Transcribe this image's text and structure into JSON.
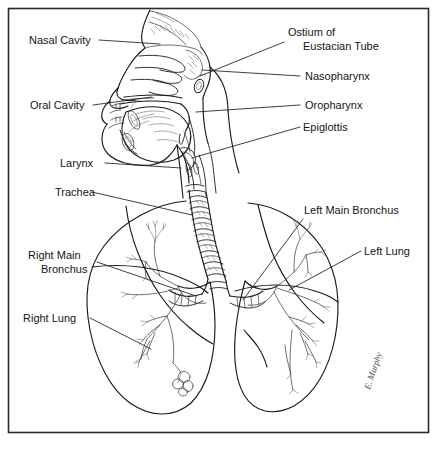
{
  "figure": {
    "background_color": "#ffffff",
    "line_color": "#1a1a1a",
    "frame_color": "#2b2b2b",
    "text_color": "#151515",
    "signature": "E. Murphy"
  },
  "labels": {
    "nasal_cavity": "Nasal Cavity",
    "oral_cavity": "Oral Cavity",
    "larynx": "Larynx",
    "trachea": "Trachea",
    "right_main_bronchus_line1": "Right Main",
    "right_main_bronchus_line2": "Bronchus",
    "right_lung": "Right Lung",
    "ostium_line1": "Ostium of",
    "ostium_line2": "Eustacian Tube",
    "nasopharynx": "Nasopharynx",
    "oropharynx": "Oropharynx",
    "epiglottis": "Epiglottis",
    "left_main_bronchus": "Left Main Bronchus",
    "left_lung": "Left Lung"
  },
  "structures": [
    "head-sagittal-outline",
    "nasal-turbinates",
    "frontal-sinus",
    "sphenoid-sinus",
    "hard-palate",
    "soft-palate",
    "tongue",
    "uvula",
    "mandible",
    "pharynx",
    "epiglottis",
    "larynx",
    "trachea-cartilage-rings",
    "carina",
    "right-main-bronchus",
    "left-main-bronchus",
    "right-lung",
    "left-lung",
    "bronchial-tree-right",
    "bronchial-tree-left",
    "alveolar-cluster",
    "horizontal-fissure",
    "oblique-fissure"
  ]
}
